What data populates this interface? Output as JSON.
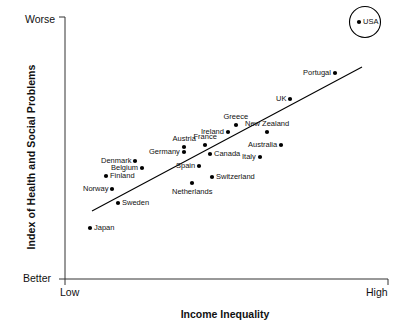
{
  "chart_data": {
    "type": "scatter",
    "title": "",
    "xlabel": "Income Inequality",
    "ylabel": "Index of Health and Social Problems",
    "x_tick_labels": [
      "Low",
      "High"
    ],
    "y_tick_labels": [
      "Worse",
      "Better"
    ],
    "grid": false,
    "legend": "none",
    "axis_note": "Qualitative axes: x from Low to High income inequality; y from Better (bottom) to Worse (top) index of health and social problems.",
    "trendline": {
      "present": true,
      "description": "Straight positive-slope regression line from lower-left to upper-right",
      "x_start_px": 92,
      "y_start_px": 211,
      "x_end_px": 362,
      "y_end_px": 67
    },
    "highlight": {
      "label": "USA",
      "shape": "circle-outline",
      "note": "USA is circled as an outlier at the extreme worse/high corner"
    },
    "points": [
      {
        "label": "Japan",
        "x_px": 90,
        "y_px": 228,
        "label_side": "right"
      },
      {
        "label": "Sweden",
        "x_px": 118,
        "y_px": 203,
        "label_side": "right"
      },
      {
        "label": "Norway",
        "x_px": 112,
        "y_px": 189,
        "label_side": "left"
      },
      {
        "label": "Finland",
        "x_px": 106,
        "y_px": 176,
        "label_side": "right"
      },
      {
        "label": "Netherlands",
        "x_px": 192,
        "y_px": 183,
        "label_side": "below"
      },
      {
        "label": "Switzerland",
        "x_px": 212,
        "y_px": 177,
        "label_side": "right"
      },
      {
        "label": "Belgium",
        "x_px": 142,
        "y_px": 168,
        "label_side": "left"
      },
      {
        "label": "Spain",
        "x_px": 199,
        "y_px": 166,
        "label_side": "left"
      },
      {
        "label": "Denmark",
        "x_px": 135,
        "y_px": 161,
        "label_side": "left"
      },
      {
        "label": "Italy",
        "x_px": 260,
        "y_px": 157,
        "label_side": "left"
      },
      {
        "label": "Canada",
        "x_px": 210,
        "y_px": 154,
        "label_side": "right"
      },
      {
        "label": "Germany",
        "x_px": 184,
        "y_px": 152,
        "label_side": "left"
      },
      {
        "label": "Austria",
        "x_px": 184,
        "y_px": 147,
        "label_side": "above"
      },
      {
        "label": "France",
        "x_px": 205,
        "y_px": 145,
        "label_side": "above"
      },
      {
        "label": "Australia",
        "x_px": 281,
        "y_px": 145,
        "label_side": "left"
      },
      {
        "label": "Ireland",
        "x_px": 228,
        "y_px": 132,
        "label_side": "left"
      },
      {
        "label": "New Zealand",
        "x_px": 267,
        "y_px": 132,
        "label_side": "above"
      },
      {
        "label": "Greece",
        "x_px": 236,
        "y_px": 125,
        "label_side": "above"
      },
      {
        "label": "UK",
        "x_px": 290,
        "y_px": 99,
        "label_side": "left"
      },
      {
        "label": "Portugal",
        "x_px": 335,
        "y_px": 73,
        "label_side": "left"
      },
      {
        "label": "USA",
        "x_px": 359,
        "y_px": 22,
        "label_side": "right"
      }
    ]
  },
  "colors": {
    "background": "#ffffff",
    "axis": "#333333",
    "point": "#000000",
    "text": "#111111",
    "trendline": "#000000"
  }
}
